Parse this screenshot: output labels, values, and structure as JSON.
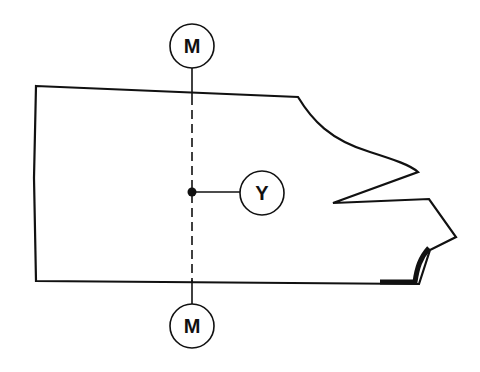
{
  "diagram": {
    "type": "technical-outline",
    "colors": {
      "stroke": "#111111",
      "background": "#ffffff"
    },
    "labels": {
      "top_marker": "M",
      "bottom_marker": "M",
      "point_marker": "Y"
    },
    "markers": [
      {
        "id": "top-m",
        "label": "M",
        "cx": 192,
        "cy": 46,
        "r": 22
      },
      {
        "id": "bottom-m",
        "label": "M",
        "cx": 192,
        "cy": 326,
        "r": 22
      },
      {
        "id": "point-y",
        "label": "Y",
        "cx": 262,
        "cy": 194,
        "r": 22
      }
    ],
    "reference_point": {
      "x": 192,
      "y": 192
    },
    "centerline": {
      "x": 192,
      "y_start": 68,
      "y_end": 304,
      "style": "dashed"
    }
  }
}
